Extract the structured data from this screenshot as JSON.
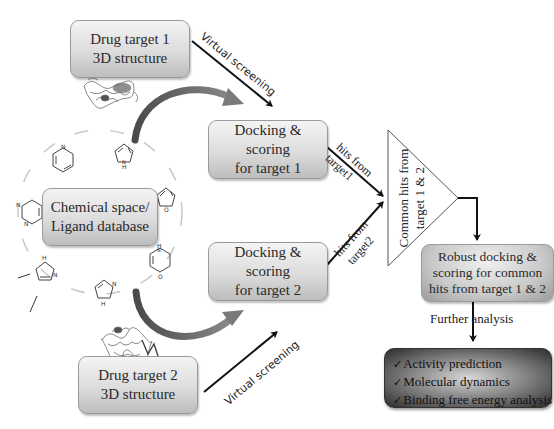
{
  "diagram": {
    "nodes": {
      "target1": {
        "line1": "Drug target 1",
        "line2": "3D structure"
      },
      "target2": {
        "line1": "Drug target 2",
        "line2": "3D structure"
      },
      "chem_space": {
        "line1": "Chemical space/",
        "line2": "Ligand database"
      },
      "dock1": {
        "line1": "Docking &",
        "line2": "scoring",
        "line3": "for target 1"
      },
      "dock2": {
        "line1": "Docking &",
        "line2": "scoring",
        "line3": "for target 2"
      },
      "common_hits": {
        "line1": "Common hits from",
        "line2": "target 1 & 2"
      },
      "robust": {
        "line1": "Robust docking &",
        "line2": "scoring for common",
        "line3": "hits from target 1 & 2"
      },
      "final": {
        "items": [
          "Activity prediction",
          "Molecular dynamics",
          "Binding free energy analysis"
        ],
        "check_icon": "✓"
      }
    },
    "edge_labels": {
      "vs1": "Virtual screening",
      "vs2": "Virtual screening",
      "hits1_a": "hits from",
      "hits1_b": "target1",
      "hits2_a": "hits from",
      "hits2_b": "target2",
      "further": "Further analysis"
    },
    "molecule_labels": {
      "pyrrole_nh": "H",
      "n": "N",
      "o": "O"
    },
    "colors": {
      "arrow": "#111111",
      "curved_arrow": "#6a6a6a",
      "box_border": "#9a9a9a",
      "final_dark": "#2c2c2c"
    }
  }
}
